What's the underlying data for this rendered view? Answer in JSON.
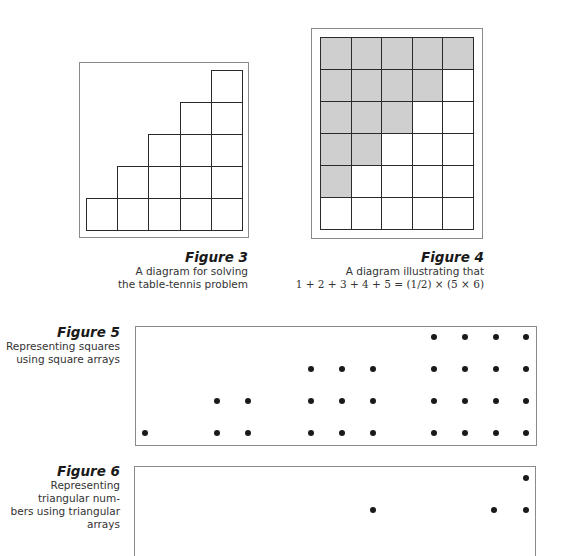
{
  "figures": [
    {
      "id": "figure-3",
      "title": "Figure 3",
      "caption_lines": [
        "A diagram for solving",
        "the table-tennis problem"
      ],
      "diagram": "staircase",
      "columns": 5,
      "column_heights": [
        1,
        2,
        3,
        4,
        5
      ]
    },
    {
      "id": "figure-4",
      "title": "Figure 4",
      "caption_lines": [
        "A diagram illustrating that",
        "1 + 2 + 3 + 4 + 5 = (1/2) × (5 × 6)"
      ],
      "diagram": "grid",
      "columns": 5,
      "rows": 6,
      "shaded_per_row": [
        5,
        4,
        3,
        2,
        1,
        0
      ],
      "shade_color": "#cfcfcf"
    },
    {
      "id": "figure-5",
      "title": "Figure 5",
      "caption_lines": [
        "Representing squares",
        "using square arrays"
      ],
      "diagram": "dot-arrays",
      "arrays": [
        1,
        4,
        9,
        16
      ]
    },
    {
      "id": "figure-6",
      "title": "Figure 6",
      "caption_lines": [
        "Representing triangular num-",
        "bers using triangular arrays"
      ],
      "diagram": "dot-arrays",
      "arrays_partially_visible": true
    }
  ]
}
